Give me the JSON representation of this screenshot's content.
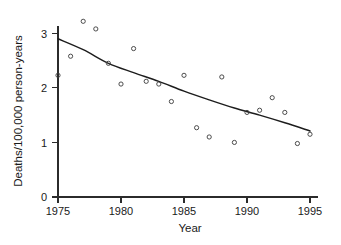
{
  "chart_data": {
    "type": "scatter",
    "title": "",
    "subtitle": "",
    "xlabel": "Year",
    "ylabel": "Deaths/100,000 person-years",
    "xlim": [
      1974,
      1996
    ],
    "ylim": [
      0,
      3.35
    ],
    "xticks": [
      1975,
      1980,
      1985,
      1990,
      1995
    ],
    "xtick_labels": [
      "1975",
      "1980",
      "1985",
      "1990",
      "1995"
    ],
    "yticks": [
      0,
      1,
      2,
      3
    ],
    "ytick_labels": [
      "0",
      "1",
      "2",
      "3"
    ],
    "grid": false,
    "legend": false,
    "legend_position": "none",
    "marker_style": "open-circle",
    "series": [
      {
        "name": "Observed mortality rate",
        "type": "scatter",
        "x": [
          1975,
          1976,
          1977,
          1978,
          1979,
          1980,
          1981,
          1982,
          1983,
          1984,
          1985,
          1986,
          1987,
          1988,
          1989,
          1990,
          1991,
          1992,
          1993,
          1994,
          1995
        ],
        "values": [
          2.23,
          2.58,
          3.22,
          3.08,
          2.45,
          2.07,
          2.72,
          2.12,
          2.07,
          1.75,
          2.23,
          1.27,
          1.1,
          2.2,
          1.0,
          1.55,
          1.59,
          1.82,
          1.55,
          0.98,
          1.15
        ]
      },
      {
        "name": "Fitted trend curve",
        "type": "line",
        "x": [
          1975,
          1977,
          1979,
          1981,
          1983,
          1985,
          1987,
          1989,
          1991,
          1993,
          1995
        ],
        "values": [
          2.9,
          2.7,
          2.45,
          2.28,
          2.12,
          1.94,
          1.78,
          1.63,
          1.5,
          1.36,
          1.21
        ]
      }
    ]
  },
  "axes": {
    "x_axis_name": "Year",
    "y_axis_name": "Deaths/100,000 person-years"
  }
}
